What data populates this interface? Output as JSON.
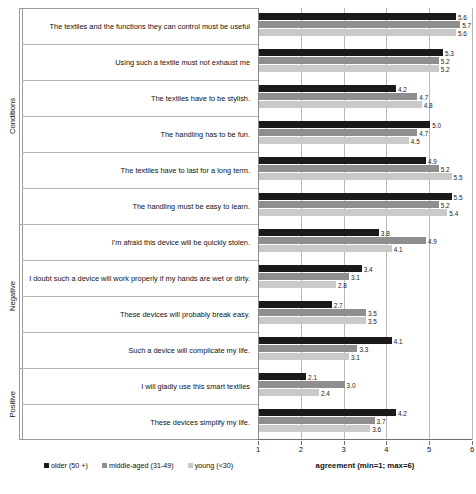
{
  "chart_data": {
    "type": "bar",
    "orientation": "horizontal",
    "title": "",
    "xlabel": "agreement (min=1; max=6)",
    "ylabel": "",
    "xlim": [
      1,
      6
    ],
    "xticks": [
      1,
      2,
      3,
      4,
      5,
      6
    ],
    "grid": true,
    "legend_position": "bottom-left",
    "group_labels": [
      "Conditions",
      "Negative",
      "Positive"
    ],
    "series": [
      {
        "name": "older (50 +)",
        "color": "#1a1a1a"
      },
      {
        "name": "middle-aged (31-49)",
        "color": "#8e8e8e"
      },
      {
        "name": "young (<30)",
        "color": "#c9c9c9"
      }
    ],
    "categories": [
      "The textiles and the functions they can control must be useful",
      "Using such a textile must not exhaust me",
      "The textiles have to be stylish.",
      "The handling has to be fun.",
      "The textiles have to last for a long term.",
      "The handling must be easy to learn.",
      "I'm afraid this device will be quickly stolen.",
      "I doubt such a device will work properly if my hands are wet or dirty.",
      "These devices will probably break easy.",
      "Such a device will complicate my life.",
      "I will gladly use this smart textiles",
      "These devices simplify my life."
    ],
    "group_of_category": [
      0,
      0,
      0,
      0,
      0,
      0,
      1,
      1,
      1,
      1,
      2,
      2
    ],
    "values": {
      "older (50 +)": [
        5.6,
        5.3,
        4.2,
        5.0,
        4.9,
        5.5,
        3.8,
        3.4,
        2.7,
        4.1,
        2.1,
        4.2
      ],
      "middle-aged (31-49)": [
        5.7,
        5.2,
        4.7,
        4.7,
        5.2,
        5.2,
        4.9,
        3.1,
        3.5,
        3.3,
        3.0,
        3.7
      ],
      "young (<30)": [
        5.6,
        5.2,
        4.8,
        4.5,
        5.5,
        5.4,
        4.1,
        2.8,
        3.5,
        3.1,
        2.4,
        3.6
      ]
    },
    "value_labels": {
      "older (50 +)": [
        "5.6",
        "5.3",
        "4.2",
        "5.0",
        "4.9",
        "5.5",
        "3.8",
        "3.4",
        "2.7",
        "4.1",
        "2.1",
        "4.2"
      ],
      "middle-aged (31-49)": [
        "5.7",
        "5.2",
        "4.7",
        "4.7",
        "5.2",
        "5.2",
        "4.9",
        "3.1",
        "3.5",
        "3.3",
        "3.0",
        "3.7"
      ],
      "young (<30)": [
        "5.6",
        "5.2",
        "4.8",
        "4.5",
        "5.5",
        "5.4",
        "4.1",
        "2.8",
        "3.5",
        "3.1",
        "2.4",
        "3.6"
      ]
    }
  }
}
